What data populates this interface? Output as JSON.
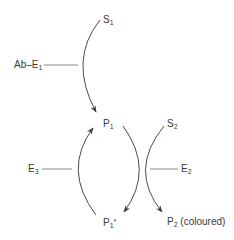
{
  "diagram": {
    "type": "enzyme-amplification-cycle",
    "nodes": {
      "s1": {
        "base": "S",
        "sub": "1"
      },
      "ab_e1": {
        "base": "Ab–E",
        "sub": "1"
      },
      "p1": {
        "base": "P",
        "sub": "1"
      },
      "s2": {
        "base": "S",
        "sub": "2"
      },
      "e3": {
        "base": "E",
        "sub": "3"
      },
      "e2": {
        "base": "E",
        "sub": "2"
      },
      "p1_star": {
        "base": "P",
        "sub": "1",
        "sup": "*"
      },
      "p2": {
        "base": "P",
        "sub": "2",
        "suffix": "(coloured)"
      }
    },
    "edges": [
      {
        "from": "S1",
        "to": "P1",
        "catalyst": "Ab–E1"
      },
      {
        "from": "P1",
        "to": "P1*",
        "coupled_with": "S2 → P2 (coloured)",
        "catalyst": "E2"
      },
      {
        "from": "P1*",
        "to": "P1",
        "catalyst": "E3"
      }
    ],
    "colors": {
      "stroke": "#4a4a4a",
      "text": "#3a3a3a",
      "background": "#ffffff"
    }
  }
}
